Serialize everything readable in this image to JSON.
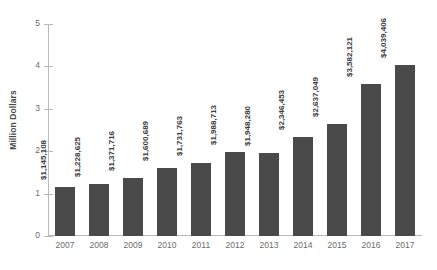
{
  "chart_data": {
    "type": "bar",
    "title": "",
    "xlabel": "",
    "ylabel": "Million Dollars",
    "categories": [
      "2007",
      "2008",
      "2009",
      "2010",
      "2011",
      "2012",
      "2013",
      "2014",
      "2015",
      "2016",
      "2017"
    ],
    "values": [
      1145108,
      1228625,
      1371716,
      1600689,
      1731763,
      1988713,
      1948280,
      2346453,
      2637049,
      3582121,
      4039406
    ],
    "value_labels": [
      "$1,145,108",
      "$1,228,625",
      "$1,371,716",
      "$1,600,689",
      "$1,731,763",
      "$1,988,713",
      "$1,948,280",
      "$2,346,453",
      "$2,637,049",
      "$3,582,121",
      "$4,039,406"
    ],
    "value_scale_divisor": 1000000,
    "ylim": [
      0,
      5
    ],
    "yticks": [
      0,
      1,
      2,
      3,
      4,
      5
    ],
    "ytick_labels": [
      "0",
      "1",
      "2",
      "3",
      "4",
      "5"
    ],
    "grid": false,
    "legend": false,
    "legend_position": "none",
    "bar_color": "#4a4a4a",
    "axis_color": "#b9b9b9",
    "tick_label_color": "#6b6b6b",
    "value_label_color": "#3d3d3d",
    "background_color": "#ffffff"
  }
}
